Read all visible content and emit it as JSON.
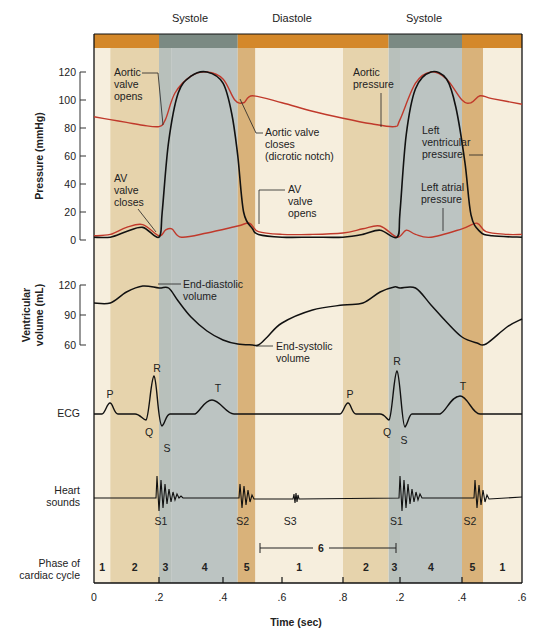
{
  "header_labels": [
    "Systole",
    "Diastole",
    "Systole"
  ],
  "colors": {
    "band_systole": "#7b8a83",
    "band_diastole": "#d4882a",
    "phase1": "#f6eedd",
    "phase2": "#e6d3ac",
    "phase3": "#b8c0bb",
    "phase4": "#bcc4c2",
    "phase5": "#d9b27a",
    "aortic_pressure": "#c0392b",
    "atrial_pressure": "#c0392b",
    "ventricular_pressure": "#111111",
    "trace": "#111111"
  },
  "chart_data": {
    "type": "line",
    "title": "",
    "xlabel": "Time (sec)",
    "x_ticks": [
      "0",
      ".2",
      ".4",
      ".6",
      ".8",
      ".2",
      ".4",
      ".6"
    ],
    "x_tick_times": [
      0,
      0.2,
      0.4,
      0.6,
      0.8,
      1.0,
      1.2,
      1.4
    ],
    "xlim": [
      0,
      1.4
    ],
    "phases": {
      "label": "Phase of cardiac cycle",
      "segments": [
        {
          "phase": "1",
          "start": 0.0,
          "end": 0.05
        },
        {
          "phase": "2",
          "start": 0.05,
          "end": 0.2
        },
        {
          "phase": "3",
          "start": 0.2,
          "end": 0.24
        },
        {
          "phase": "4",
          "start": 0.24,
          "end": 0.45
        },
        {
          "phase": "5",
          "start": 0.45,
          "end": 0.51
        },
        {
          "phase": "1",
          "start": 0.51,
          "end": 0.8
        },
        {
          "phase": "2",
          "start": 0.8,
          "end": 0.96
        },
        {
          "phase": "3",
          "start": 0.96,
          "end": 1.0
        },
        {
          "phase": "4",
          "start": 1.0,
          "end": 1.2
        },
        {
          "phase": "5",
          "start": 1.2,
          "end": 1.27
        },
        {
          "phase": "1",
          "start": 1.27,
          "end": 1.4
        }
      ],
      "bracket": {
        "label": "6",
        "start": 0.51,
        "end": 0.96
      }
    },
    "systole_diastole": [
      {
        "label": "Diastole",
        "start": 0.0,
        "end": 0.2
      },
      {
        "label": "Systole",
        "start": 0.2,
        "end": 0.45
      },
      {
        "label": "Diastole",
        "start": 0.45,
        "end": 0.96
      },
      {
        "label": "Systole",
        "start": 0.96,
        "end": 1.2
      },
      {
        "label": "Diastole",
        "start": 1.2,
        "end": 1.4
      }
    ],
    "panels": [
      {
        "name": "pressure",
        "ylabel": "Pressure (mmHg)",
        "yticks": [
          0,
          20,
          40,
          60,
          80,
          100,
          120
        ],
        "ylim": [
          0,
          120
        ],
        "series": [
          {
            "name": "Aortic pressure",
            "color": "#c0392b",
            "t": [
              0,
              0.05,
              0.1,
              0.15,
              0.2,
              0.22,
              0.25,
              0.3,
              0.35,
              0.4,
              0.44,
              0.47,
              0.5,
              0.6,
              0.7,
              0.8,
              0.9,
              0.98,
              1.0,
              1.05,
              1.1,
              1.15,
              1.2,
              1.23,
              1.26,
              1.3,
              1.4
            ],
            "v": [
              88,
              86,
              84,
              82,
              81,
              86,
              105,
              117,
              120,
              115,
              100,
              98,
              103,
              98,
              92,
              87,
              83,
              81,
              86,
              112,
              120,
              115,
              100,
              98,
              103,
              101,
              97
            ]
          },
          {
            "name": "Left ventricular pressure",
            "color": "#111111",
            "t": [
              0,
              0.05,
              0.1,
              0.15,
              0.2,
              0.21,
              0.23,
              0.26,
              0.3,
              0.35,
              0.4,
              0.43,
              0.45,
              0.47,
              0.5,
              0.52,
              0.6,
              0.7,
              0.8,
              0.87,
              0.93,
              0.99,
              1.0,
              1.02,
              1.05,
              1.1,
              1.15,
              1.18,
              1.21,
              1.23,
              1.26,
              1.3,
              1.4
            ],
            "v": [
              2,
              2,
              6,
              9,
              2,
              20,
              70,
              105,
              117,
              120,
              112,
              90,
              60,
              20,
              8,
              4,
              2,
              2,
              2,
              4,
              7,
              2,
              20,
              75,
              108,
              120,
              115,
              95,
              55,
              18,
              6,
              3,
              2
            ]
          },
          {
            "name": "Left atrial pressure",
            "color": "#c0392b",
            "t": [
              0,
              0.05,
              0.1,
              0.15,
              0.2,
              0.22,
              0.24,
              0.27,
              0.35,
              0.45,
              0.49,
              0.52,
              0.6,
              0.7,
              0.8,
              0.87,
              0.93,
              0.99,
              1.02,
              1.05,
              1.1,
              1.2,
              1.25,
              1.28,
              1.35,
              1.4
            ],
            "v": [
              3,
              4,
              9,
              11,
              3,
              7,
              8,
              2,
              5,
              10,
              12,
              6,
              4,
              4,
              5,
              8,
              10,
              2,
              7,
              4,
              2,
              8,
              12,
              6,
              4,
              4
            ]
          }
        ],
        "annotations": [
          "Aortic valve opens",
          "Aortic valve closes (dicrotic notch)",
          "AV valve closes",
          "AV valve opens",
          "Aortic pressure",
          "Left ventricular pressure",
          "Left atrial pressure"
        ]
      },
      {
        "name": "volume",
        "ylabel": "Ventricular volume (mL)",
        "yticks": [
          60,
          90,
          120
        ],
        "ylim": [
          60,
          120
        ],
        "series": [
          {
            "name": "Ventricular volume",
            "color": "#111111",
            "t": [
              0,
              0.05,
              0.1,
              0.15,
              0.2,
              0.23,
              0.26,
              0.3,
              0.35,
              0.4,
              0.45,
              0.5,
              0.52,
              0.55,
              0.6,
              0.7,
              0.8,
              0.87,
              0.93,
              0.98,
              1.0,
              1.05,
              1.1,
              1.15,
              1.2,
              1.25,
              1.28,
              1.35,
              1.4
            ],
            "v": [
              102,
              102,
              113,
              119,
              117,
              117,
              104,
              88,
              74,
              65,
              61,
              60,
              60,
              68,
              82,
              95,
              100,
              102,
              113,
              118,
              117,
              117,
              100,
              83,
              68,
              62,
              61,
              78,
              86
            ]
          }
        ],
        "annotations": [
          "End-diastolic volume",
          "End-systolic volume"
        ]
      },
      {
        "name": "ecg",
        "ylabel": "ECG",
        "wave_labels": [
          "P",
          "Q",
          "R",
          "S",
          "T",
          "P",
          "Q",
          "R",
          "S",
          "T"
        ]
      },
      {
        "name": "heart_sounds",
        "ylabel": "Heart sounds",
        "sound_labels": [
          {
            "label": "S1",
            "t": 0.2
          },
          {
            "label": "S2",
            "t": 0.46
          },
          {
            "label": "S3",
            "t": 0.62
          },
          {
            "label": "S1",
            "t": 0.98
          },
          {
            "label": "S2",
            "t": 1.22
          }
        ]
      }
    ]
  },
  "axis_labels": {
    "pressure": "Pressure (mmHg)",
    "volume_line1": "Ventricular",
    "volume_line2": "volume (mL)",
    "ecg": "ECG",
    "heart_line1": "Heart",
    "heart_line2": "sounds",
    "phase_line1": "Phase of",
    "phase_line2": "cardiac cycle",
    "time": "Time (sec)"
  },
  "annotations": {
    "aortic_valve_opens": [
      "Aortic",
      "valve",
      "opens"
    ],
    "aortic_valve_closes": [
      "Aortic valve",
      "closes",
      "(dicrotic notch)"
    ],
    "av_valve_closes": [
      "AV",
      "valve",
      "closes"
    ],
    "av_valve_opens": [
      "AV",
      "valve",
      "opens"
    ],
    "aortic_pressure": [
      "Aortic",
      "pressure"
    ],
    "left_ventricular_pressure": [
      "Left",
      "ventricular",
      "pressure"
    ],
    "left_atrial_pressure": [
      "Left atrial",
      "pressure"
    ],
    "end_diastolic_volume": [
      "End-diastolic",
      "volume"
    ],
    "end_systolic_volume": [
      "End-systolic",
      "volume"
    ]
  }
}
